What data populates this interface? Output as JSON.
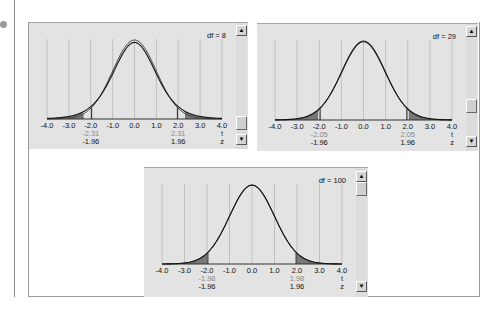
{
  "page": {
    "bullet_icon": "bullet-icon",
    "scroll_up_glyph": "▲",
    "scroll_down_glyph": "▼"
  },
  "chart_data": [
    {
      "type": "line",
      "title": "df = 8",
      "df": 8,
      "xlim": [
        -4.0,
        4.0
      ],
      "x_ticks": [
        "-4.0",
        "-3.0",
        "-2.0",
        "-1.0",
        "0.0",
        "1.0",
        "2.0",
        "3.0",
        "4.0"
      ],
      "series": [
        {
          "name": "t distribution (df = 8)",
          "critical": [
            -2.31,
            2.31
          ]
        },
        {
          "name": "standard normal z",
          "critical": [
            -1.96,
            1.96
          ]
        }
      ],
      "t_labels": [
        "-2.31",
        "2.31"
      ],
      "z_labels": [
        "-1.96",
        "1.96"
      ],
      "row_labels": {
        "t": "t",
        "z": "z"
      },
      "shaded_tails": true,
      "grid": true,
      "scroll_position": 0.85
    },
    {
      "type": "line",
      "title": "df = 29",
      "df": 29,
      "xlim": [
        -4.0,
        4.0
      ],
      "x_ticks": [
        "-4.0",
        "-3.0",
        "-2.0",
        "-1.0",
        "0.0",
        "1.0",
        "2.0",
        "3.0",
        "4.0"
      ],
      "series": [
        {
          "name": "t distribution (df = 29)",
          "critical": [
            -2.05,
            2.05
          ]
        },
        {
          "name": "standard normal z",
          "critical": [
            -1.96,
            1.96
          ]
        }
      ],
      "t_labels": [
        "-2.05",
        "2.05"
      ],
      "z_labels": [
        "-1.96",
        "1.96"
      ],
      "row_labels": {
        "t": "t",
        "z": "z"
      },
      "shaded_tails": true,
      "grid": true,
      "scroll_position": 0.8
    },
    {
      "type": "line",
      "title": "df = 100",
      "df": 100,
      "xlim": [
        -4.0,
        4.0
      ],
      "x_ticks": [
        "-4.0",
        "-3.0",
        "-2.0",
        "-1.0",
        "0.0",
        "1.0",
        "2.0",
        "3.0",
        "4.0"
      ],
      "series": [
        {
          "name": "t distribution (df = 100)",
          "critical": [
            -1.98,
            1.98
          ]
        },
        {
          "name": "standard normal z",
          "critical": [
            -1.96,
            1.96
          ]
        }
      ],
      "t_labels": [
        "-1.98",
        "1.98"
      ],
      "z_labels": [
        "-1.96",
        "1.96"
      ],
      "row_labels": {
        "t": "t",
        "z": "z"
      },
      "shaded_tails": true,
      "grid": true,
      "scroll_position": 0.05
    }
  ]
}
